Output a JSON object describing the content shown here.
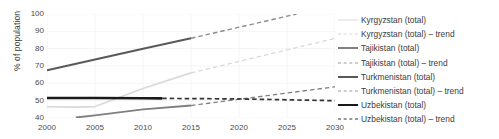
{
  "chart_data": {
    "type": "line",
    "title": "",
    "xlabel": "",
    "ylabel": "% of population",
    "xlim": [
      2000,
      2030
    ],
    "ylim": [
      40,
      100
    ],
    "xticks": [
      2000,
      2005,
      2010,
      2015,
      2020,
      2025,
      2030
    ],
    "yticks": [
      40,
      50,
      60,
      70,
      80,
      90,
      100
    ],
    "grid": true,
    "legend_position": "right",
    "series": [
      {
        "name": "Kyrgyzstan (total)",
        "style": "solid",
        "color": "#d9d9d9",
        "x": [
          2000,
          2003,
          2005,
          2010,
          2015
        ],
        "values": [
          46.5,
          46.3,
          46.6,
          57.0,
          66.0
        ]
      },
      {
        "name": "Kyrgyzstan (total) – trend",
        "style": "dashed",
        "color": "#d9d9d9",
        "x": [
          2015,
          2030
        ],
        "values": [
          66.0,
          86.0
        ]
      },
      {
        "name": "Tajikistan (total)",
        "style": "solid",
        "color": "#7f7f7f",
        "x": [
          2003,
          2005,
          2010,
          2015
        ],
        "values": [
          40.3,
          41.5,
          45.0,
          47.2
        ]
      },
      {
        "name": "Tajikistan (total) – trend",
        "style": "dashed",
        "color": "#7f7f7f",
        "x": [
          2015,
          2030
        ],
        "values": [
          47.2,
          58.0
        ]
      },
      {
        "name": "Turkmenistan (total)",
        "style": "solid",
        "color": "#595959",
        "x": [
          2000,
          2005,
          2010,
          2015
        ],
        "values": [
          67.5,
          73.8,
          80.0,
          86.0
        ]
      },
      {
        "name": "Turkmenistan (total) – trend",
        "style": "dashed",
        "color": "#8c8c8c",
        "x": [
          2015,
          2026
        ],
        "values": [
          86.0,
          100.0
        ]
      },
      {
        "name": "Uzbekistan (total)",
        "style": "solid",
        "color": "#1a1a1a",
        "x": [
          2000,
          2005,
          2010,
          2012
        ],
        "values": [
          51.5,
          51.5,
          51.4,
          51.3
        ]
      },
      {
        "name": "Uzbekistan (total) – trend",
        "style": "dashed",
        "color": "#333333",
        "x": [
          2012,
          2020,
          2030
        ],
        "values": [
          51.3,
          51.0,
          50.0
        ]
      }
    ]
  },
  "legend": {
    "items": [
      {
        "label": "Kyrgyzstan (total)",
        "color": "#d9d9d9",
        "style": "solid",
        "width": 1.6
      },
      {
        "label": "Kyrgyzstan (total) – trend",
        "color": "#d9d9d9",
        "style": "dashed",
        "width": 1.3
      },
      {
        "label": "Tajikistan (total)",
        "color": "#7f7f7f",
        "style": "solid",
        "width": 2.0
      },
      {
        "label": "Tajikistan (total) – trend",
        "color": "#9a9a9a",
        "style": "dashed",
        "width": 1.3
      },
      {
        "label": "Turkmenistan (total)",
        "color": "#595959",
        "style": "solid",
        "width": 2.0
      },
      {
        "label": "Turkmenistan (total) – trend",
        "color": "#9a9a9a",
        "style": "dashed",
        "width": 1.3
      },
      {
        "label": "Uzbekistan (total)",
        "color": "#1a1a1a",
        "style": "solid",
        "width": 2.4
      },
      {
        "label": "Uzbekistan (total) – trend",
        "color": "#333333",
        "style": "dashed",
        "width": 1.4
      }
    ]
  },
  "axis": {
    "y_title": "% of population",
    "y_tick_labels": [
      "100",
      "90",
      "80",
      "70",
      "60",
      "50",
      "40"
    ],
    "x_tick_labels": [
      "2000",
      "2005",
      "2010",
      "2015",
      "2020",
      "2025",
      "2030"
    ]
  }
}
